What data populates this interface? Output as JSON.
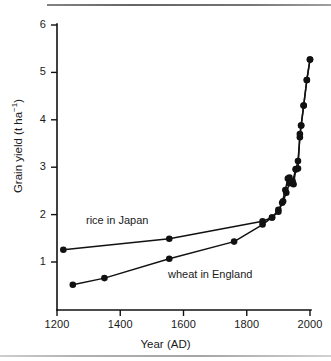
{
  "chart_data": {
    "type": "line",
    "title": "",
    "xlabel": "Year (AD)",
    "ylabel": "Grain yield (t ha",
    "ylabel_sup": "-1",
    "ylabel_tail": ")",
    "xlim": [
      1200,
      2000
    ],
    "ylim": [
      0,
      6
    ],
    "xticks": [
      1200,
      1400,
      1600,
      1800,
      2000
    ],
    "yticks": [
      1,
      2,
      3,
      4,
      5,
      6
    ],
    "grid": false,
    "legend_position": "inline-annotations",
    "annotations": [
      {
        "text": "rice in Japan",
        "series": "rice_in_japan"
      },
      {
        "text": "wheat in England",
        "series": "wheat_in_england"
      }
    ],
    "series": [
      {
        "name": "rice in Japan",
        "marker": "filled-circle",
        "points": [
          {
            "x": 1220,
            "y": 1.26
          },
          {
            "x": 1555,
            "y": 1.49
          },
          {
            "x": 1850,
            "y": 1.86
          },
          {
            "x": 1880,
            "y": 1.94
          },
          {
            "x": 1900,
            "y": 2.1
          },
          {
            "x": 1912,
            "y": 2.25
          },
          {
            "x": 1922,
            "y": 2.52
          },
          {
            "x": 1930,
            "y": 2.76
          },
          {
            "x": 1935,
            "y": 2.78
          },
          {
            "x": 1948,
            "y": 2.64
          },
          {
            "x": 1955,
            "y": 2.95
          },
          {
            "x": 1962,
            "y": 3.13
          },
          {
            "x": 1968,
            "y": 3.63
          },
          {
            "x": 1972,
            "y": 3.88
          },
          {
            "x": 1980,
            "y": 4.3
          },
          {
            "x": 1990,
            "y": 4.84
          },
          {
            "x": 2000,
            "y": 5.27
          }
        ]
      },
      {
        "name": "wheat in England",
        "marker": "filled-circle",
        "points": [
          {
            "x": 1250,
            "y": 0.52
          },
          {
            "x": 1350,
            "y": 0.66
          },
          {
            "x": 1555,
            "y": 1.07
          },
          {
            "x": 1760,
            "y": 1.43
          },
          {
            "x": 1850,
            "y": 1.79
          },
          {
            "x": 1880,
            "y": 1.94
          },
          {
            "x": 1900,
            "y": 2.06
          },
          {
            "x": 1915,
            "y": 2.28
          },
          {
            "x": 1925,
            "y": 2.46
          },
          {
            "x": 1935,
            "y": 2.66
          },
          {
            "x": 1945,
            "y": 2.7
          },
          {
            "x": 1955,
            "y": 2.96
          },
          {
            "x": 1962,
            "y": 2.97
          },
          {
            "x": 1968,
            "y": 3.7
          },
          {
            "x": 1972,
            "y": 3.88
          },
          {
            "x": 1980,
            "y": 4.3
          },
          {
            "x": 1990,
            "y": 4.84
          },
          {
            "x": 2000,
            "y": 5.27
          }
        ]
      }
    ]
  },
  "axis": {
    "x_tick_labels": [
      "1200",
      "1400",
      "1600",
      "1800",
      "2000"
    ],
    "y_tick_labels": [
      "1",
      "2",
      "3",
      "4",
      "5",
      "6"
    ],
    "x_title": "Year (AD)",
    "y_title_main": "Grain yield (t ha",
    "y_title_exp": "−1",
    "y_title_end": ")"
  },
  "labels": {
    "rice": "rice in Japan",
    "wheat": "wheat in England"
  },
  "colors": {
    "ink": "#111111",
    "background": "#ffffff"
  }
}
